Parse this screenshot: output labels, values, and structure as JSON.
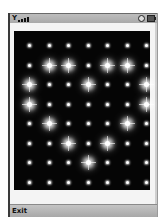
{
  "status_bar": {
    "signal_icon": "antenna-signal-icon",
    "antenna_glyph": "Y",
    "signal_bars": [
      2,
      3,
      4,
      5
    ],
    "right_icons": [
      "clock-icon",
      "battery-icon"
    ]
  },
  "dot_grid": {
    "columns": 7,
    "rows": 8,
    "background": "#050505",
    "dot_color": "#ffffff",
    "pattern": [
      [
        "s",
        "s",
        "s",
        "s",
        "s",
        "s",
        "s"
      ],
      [
        "s",
        "L",
        "L",
        "s",
        "L",
        "L",
        "s"
      ],
      [
        "L",
        "s",
        "s",
        "L",
        "s",
        "s",
        "L"
      ],
      [
        "L",
        "s",
        "s",
        "s",
        "s",
        "s",
        "L"
      ],
      [
        "s",
        "L",
        "s",
        "s",
        "s",
        "L",
        "s"
      ],
      [
        "s",
        "s",
        "L",
        "s",
        "L",
        "s",
        "s"
      ],
      [
        "s",
        "s",
        "s",
        "L",
        "s",
        "s",
        "s"
      ],
      [
        "s",
        "s",
        "s",
        "s",
        "s",
        "s",
        "s"
      ]
    ]
  },
  "soft_keys": {
    "left_label": "Exit"
  }
}
